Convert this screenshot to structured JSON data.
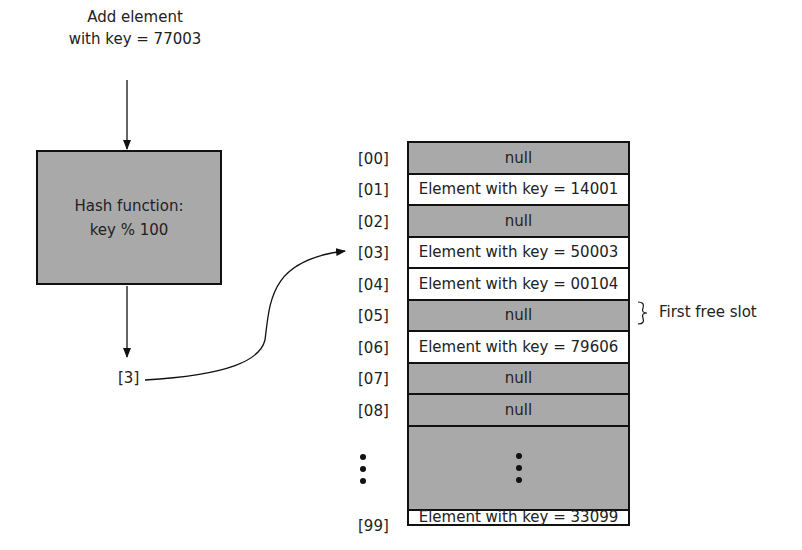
{
  "input": {
    "line1": "Add element",
    "line2": "with key = 77003"
  },
  "hash_function": {
    "line1": "Hash function:",
    "line2": "key % 100"
  },
  "hash_result": "[3]",
  "table": {
    "slots": [
      {
        "index": "[00]",
        "content": "null",
        "state": "null"
      },
      {
        "index": "[01]",
        "content": "Element with key = 14001",
        "state": "filled"
      },
      {
        "index": "[02]",
        "content": "null",
        "state": "null"
      },
      {
        "index": "[03]",
        "content": "Element with key = 50003",
        "state": "filled"
      },
      {
        "index": "[04]",
        "content": "Element with key = 00104",
        "state": "filled"
      },
      {
        "index": "[05]",
        "content": "null",
        "state": "null"
      },
      {
        "index": "[06]",
        "content": "Element with key = 79606",
        "state": "filled"
      },
      {
        "index": "[07]",
        "content": "null",
        "state": "null"
      },
      {
        "index": "[08]",
        "content": "null",
        "state": "null"
      },
      {
        "index": "...",
        "content": "...",
        "state": "ellipsis"
      },
      {
        "index": "[99]",
        "content": "Element with key = 33099",
        "state": "filled"
      }
    ]
  },
  "annotation": {
    "label": "First free slot",
    "target_index": "[05]"
  },
  "colors": {
    "null_fill": "#a9a9a9",
    "filled_fill": "#ffffff",
    "stroke": "#111111"
  }
}
